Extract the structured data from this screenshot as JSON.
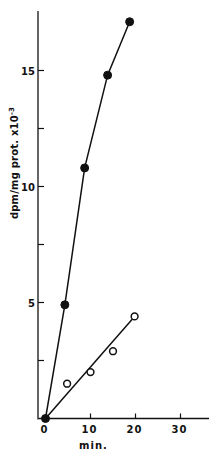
{
  "chart_data": {
    "type": "line",
    "title": "",
    "xlabel": "min.",
    "ylabel": "dpm/mg prot. x10",
    "ylabel_exponent": "-3",
    "xlim": [
      0,
      36
    ],
    "ylim": [
      0,
      17.8
    ],
    "x_ticks": [
      0,
      10,
      20,
      30
    ],
    "x_tick_labels": [
      "0",
      "10",
      "20",
      "30"
    ],
    "y_ticks": [
      0,
      2.5,
      5,
      7.5,
      10,
      12.5,
      15
    ],
    "y_tick_labels": [
      "",
      "",
      "5",
      "",
      "10",
      "",
      "15"
    ],
    "grid": false,
    "legend": "none",
    "series": [
      {
        "name": "filled circles",
        "marker": "filled-circle",
        "x": [
          0,
          4.3,
          8.7,
          13.8,
          18.7
        ],
        "y": [
          0,
          4.9,
          10.8,
          14.8,
          17.1
        ]
      },
      {
        "name": "open circles",
        "marker": "open-circle",
        "x": [
          0,
          4.8,
          10,
          15,
          19.8
        ],
        "y": [
          0,
          1.5,
          2.0,
          2.9,
          4.4
        ],
        "fit_line": {
          "x": [
            0,
            19.8
          ],
          "y": [
            0,
            4.4
          ]
        }
      }
    ]
  },
  "colors": {
    "ink": "#111111",
    "background": "#ffffff"
  }
}
